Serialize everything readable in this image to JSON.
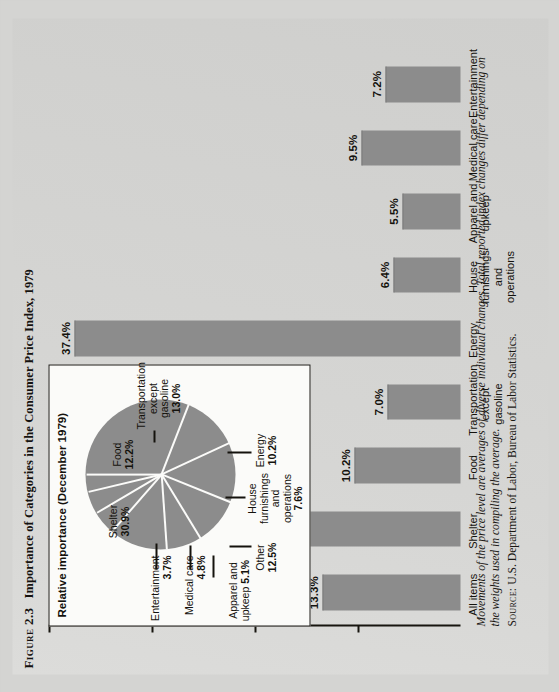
{
  "figure": {
    "number": "Figure 2.3",
    "title": "Importance of Categories in the Consumer Price Index, 1979"
  },
  "axis": {
    "ylabel": "Percent"
  },
  "inset": {
    "title": "Relative importance (December 1979)"
  },
  "note": {
    "body": "Movements of the price level are averages of diverse individual changes. Total reported index changes differ depending on the weights used in compiling the average.",
    "source_label": "Source:",
    "source_text": "U.S. Department of Labor, Bureau of Labor Statistics."
  },
  "chart_data": [
    {
      "type": "bar",
      "title": "Importance of Categories in the Consumer Price Index, 1979",
      "xlabel": "",
      "ylabel": "Percent",
      "ylim": [
        0,
        40
      ],
      "grid": false,
      "categories": [
        "All items",
        "Shelter",
        "Food",
        "Transportation except gasoline",
        "Energy",
        "House furnishings and operations",
        "Apparel and upkeep",
        "Medical care",
        "Entertainment"
      ],
      "values": [
        13.3,
        17.4,
        10.2,
        7.0,
        37.4,
        6.4,
        5.5,
        9.5,
        7.2
      ],
      "value_labels": [
        "13.3%",
        "17.4%",
        "10.2%",
        "7.0%",
        "37.4%",
        "6.4%",
        "5.5%",
        "9.5%",
        "7.2%"
      ]
    },
    {
      "type": "pie",
      "title": "Relative importance (December 1979)",
      "legend": "inline-callout",
      "labels": [
        "Shelter",
        "Food",
        "Transportation except gasoline",
        "Energy",
        "House furnishings and operations",
        "Other",
        "Apparel and upkeep",
        "Medical care",
        "Entertainment"
      ],
      "values": [
        30.9,
        12.2,
        13.0,
        10.2,
        7.6,
        12.5,
        5.1,
        4.8,
        3.7
      ],
      "value_labels": [
        "30.9%",
        "12.2%",
        "13.0%",
        "10.2%",
        "7.6%",
        "12.5%",
        "5.1%",
        "4.8%",
        "3.7%"
      ]
    }
  ]
}
